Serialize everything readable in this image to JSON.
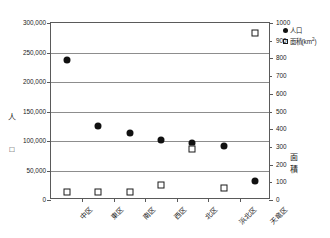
{
  "chart_data": {
    "type": "scatter",
    "title": "",
    "xlabel": "",
    "categories": [
      "中区",
      "東区",
      "南区",
      "西区",
      "北区",
      "浜北区",
      "天竜区"
    ],
    "series": [
      {
        "name": "人口",
        "marker": "filled-circle",
        "axis": "left",
        "unit": "人",
        "values": [
          238000,
          126000,
          113000,
          101000,
          96000,
          91000,
          33000
        ]
      },
      {
        "name": "面積(km²)",
        "marker": "open-square",
        "axis": "right",
        "unit": "km²",
        "values": [
          45,
          46,
          47,
          86,
          290,
          67,
          944
        ]
      }
    ],
    "left_axis": {
      "title": "人",
      "ylim": [
        0,
        300000
      ],
      "ticks": [
        0,
        50000,
        100000,
        150000,
        200000,
        250000,
        300000
      ],
      "tick_labels": [
        "0",
        "50,000",
        "100,000",
        "150,000",
        "200,000",
        "250,000",
        "300,000"
      ]
    },
    "right_axis": {
      "title": "面積",
      "ylim": [
        0,
        1000
      ],
      "ticks": [
        0,
        100,
        200,
        300,
        400,
        500,
        600,
        700,
        800,
        900,
        1000
      ],
      "tick_labels": [
        "0",
        "100",
        "200",
        "300",
        "400",
        "500",
        "600",
        "700",
        "800",
        "900",
        "1000"
      ]
    },
    "gridlines": [
      50000,
      100000,
      150000,
      200000,
      250000
    ],
    "grid": true,
    "legend": {
      "position": "top-right",
      "entries": [
        {
          "label": "人口",
          "marker": "filled-circle"
        },
        {
          "label": "面積(km",
          "suffix": "2",
          "tail": ")",
          "marker": "open-square"
        }
      ]
    }
  },
  "axis_titles": {
    "left_person": "人",
    "left_square": "□",
    "right": "面\n積"
  }
}
